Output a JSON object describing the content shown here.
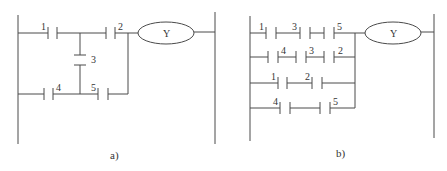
{
  "figure": {
    "diagrams": [
      {
        "id": "a",
        "caption": "a)",
        "coil_label": "Y",
        "contacts": [
          {
            "label": "1",
            "rung": "top"
          },
          {
            "label": "2",
            "rung": "top"
          },
          {
            "label": "3",
            "rung": "vertical-bridge"
          },
          {
            "label": "4",
            "rung": "bottom"
          },
          {
            "label": "5",
            "rung": "bottom"
          }
        ]
      },
      {
        "id": "b",
        "caption": "b)",
        "coil_label": "Y",
        "rungs": [
          {
            "contacts": [
              "1",
              "3",
              "5"
            ]
          },
          {
            "contacts": [
              "4",
              "3",
              "2"
            ]
          },
          {
            "contacts": [
              "1",
              "2"
            ]
          },
          {
            "contacts": [
              "4",
              "5"
            ]
          }
        ]
      }
    ],
    "colors": {
      "line": "#4a4a4a",
      "text": "#333333",
      "background": "#ffffff"
    }
  }
}
